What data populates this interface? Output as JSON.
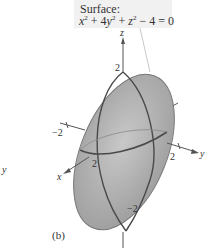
{
  "caption": {
    "title": "Surface:",
    "equation": {
      "x_term": "x",
      "x_exp": "2",
      "plus1": " + 4",
      "y_term": "y",
      "y_exp": "2",
      "plus2": " + ",
      "z_term": "z",
      "z_exp": "2",
      "rest": " − 4 = 0"
    }
  },
  "axes": {
    "z_label": "z",
    "y_label": "y",
    "x_label": "x",
    "z_top_tick": "2",
    "z_bottom_tick": "−2",
    "y_pos_tick": "2",
    "y_neg_tick": "−2",
    "x_pos_tick": "2"
  },
  "subfigure_label": "(b)",
  "edge_fragment": "y",
  "colors": {
    "surface_fill": "#a9a9a9",
    "surface_highlight": "#c8c8c8",
    "trace_line": "#4a4a4a",
    "axis_line": "#555555",
    "caption_bg": "#f1f1f1"
  }
}
